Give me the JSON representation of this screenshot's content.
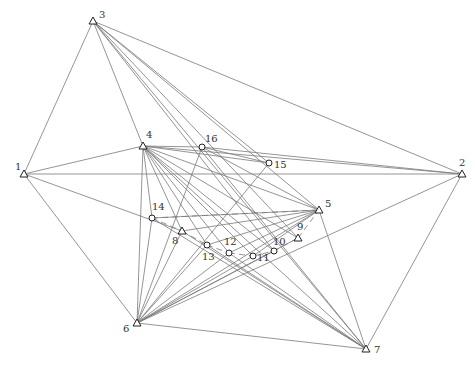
{
  "diagram": {
    "type": "network",
    "colors": {
      "line": "#7a7a7a",
      "node": "#222222",
      "label": "#333333",
      "background": "#ffffff"
    },
    "nodes": [
      {
        "id": "1",
        "label": "1",
        "shape": "triangle",
        "x": 24,
        "y": 174,
        "lx": -9,
        "ly": -4
      },
      {
        "id": "2",
        "label": "2",
        "shape": "triangle",
        "x": 462,
        "y": 174,
        "lx": -3,
        "ly": -8
      },
      {
        "id": "3",
        "label": "3",
        "shape": "triangle",
        "x": 93,
        "y": 21,
        "lx": 6,
        "ly": -3
      },
      {
        "id": "4",
        "label": "4",
        "shape": "triangle",
        "x": 143,
        "y": 146,
        "lx": 3,
        "ly": -8
      },
      {
        "id": "5",
        "label": "5",
        "shape": "triangle",
        "x": 319,
        "y": 210,
        "lx": 6,
        "ly": -3
      },
      {
        "id": "6",
        "label": "6",
        "shape": "triangle",
        "x": 137,
        "y": 323,
        "lx": -14,
        "ly": 9
      },
      {
        "id": "7",
        "label": "7",
        "shape": "triangle",
        "x": 366,
        "y": 349,
        "lx": 8,
        "ly": 4
      },
      {
        "id": "8",
        "label": "8",
        "shape": "triangle",
        "x": 182,
        "y": 231,
        "lx": -10,
        "ly": 13
      },
      {
        "id": "9",
        "label": "9",
        "shape": "triangle",
        "x": 298,
        "y": 238,
        "lx": -1,
        "ly": -8
      },
      {
        "id": "10",
        "label": "10",
        "shape": "circle",
        "x": 274,
        "y": 251,
        "lx": -1,
        "ly": -6
      },
      {
        "id": "11",
        "label": "11",
        "shape": "circle",
        "x": 253,
        "y": 256,
        "lx": 4,
        "ly": 5
      },
      {
        "id": "12",
        "label": "12",
        "shape": "circle",
        "x": 229,
        "y": 253,
        "lx": -5,
        "ly": -8
      },
      {
        "id": "13",
        "label": "13",
        "shape": "circle",
        "x": 207,
        "y": 245,
        "lx": -5,
        "ly": 15
      },
      {
        "id": "14",
        "label": "14",
        "shape": "circle",
        "x": 152,
        "y": 218,
        "lx": 0,
        "ly": -8
      },
      {
        "id": "15",
        "label": "15",
        "shape": "circle",
        "x": 269,
        "y": 163,
        "lx": 5,
        "ly": 5
      },
      {
        "id": "16",
        "label": "16",
        "shape": "circle",
        "x": 202,
        "y": 147,
        "lx": 3,
        "ly": -5
      }
    ],
    "edges": [
      [
        "1",
        "3"
      ],
      [
        "1",
        "4"
      ],
      [
        "1",
        "2"
      ],
      [
        "1",
        "6"
      ],
      [
        "1",
        "8"
      ],
      [
        "3",
        "2"
      ],
      [
        "3",
        "4"
      ],
      [
        "3",
        "5"
      ],
      [
        "3",
        "7"
      ],
      [
        "3",
        "15"
      ],
      [
        "3",
        "9"
      ],
      [
        "3",
        "10"
      ],
      [
        "2",
        "4"
      ],
      [
        "2",
        "6"
      ],
      [
        "2",
        "7"
      ],
      [
        "2",
        "16"
      ],
      [
        "4",
        "5"
      ],
      [
        "4",
        "6"
      ],
      [
        "4",
        "7"
      ],
      [
        "4",
        "16"
      ],
      [
        "4",
        "15"
      ],
      [
        "4",
        "8"
      ],
      [
        "4",
        "9"
      ],
      [
        "4",
        "10"
      ],
      [
        "4",
        "11"
      ],
      [
        "4",
        "12"
      ],
      [
        "4",
        "13"
      ],
      [
        "4",
        "14"
      ],
      [
        "5",
        "6"
      ],
      [
        "5",
        "7"
      ],
      [
        "5",
        "14"
      ],
      [
        "5",
        "13"
      ],
      [
        "5",
        "12"
      ],
      [
        "5",
        "11"
      ],
      [
        "5",
        "8"
      ],
      [
        "6",
        "7"
      ],
      [
        "6",
        "8"
      ],
      [
        "6",
        "9"
      ],
      [
        "6",
        "10"
      ],
      [
        "6",
        "11"
      ],
      [
        "6",
        "12"
      ],
      [
        "6",
        "13"
      ],
      [
        "6",
        "14"
      ],
      [
        "6",
        "15"
      ],
      [
        "6",
        "16"
      ],
      [
        "7",
        "8"
      ],
      [
        "7",
        "14"
      ],
      [
        "7",
        "13"
      ],
      [
        "7",
        "12"
      ],
      [
        "7",
        "16"
      ],
      [
        "16",
        "15"
      ],
      [
        "16",
        "5"
      ]
    ],
    "dashed_edges": [
      [
        "14",
        "8"
      ],
      [
        "8",
        "13"
      ],
      [
        "13",
        "12"
      ],
      [
        "12",
        "11"
      ],
      [
        "11",
        "10"
      ],
      [
        "10",
        "9"
      ],
      [
        "9",
        "5"
      ],
      [
        "14",
        "5"
      ]
    ]
  }
}
